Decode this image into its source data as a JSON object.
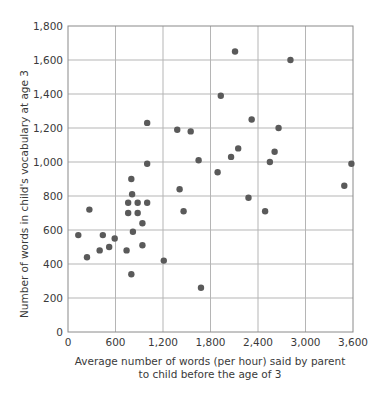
{
  "chart_data": {
    "type": "scatter",
    "title": "",
    "xlabel": "Average number of words (per hour) said by parent to child before the age of 3",
    "xlabel_lines": [
      "Average number of words (per hour) said by parent",
      "to child before the age of 3"
    ],
    "ylabel": "Number of words in child's vocabulary at age 3",
    "xlim": [
      0,
      3600
    ],
    "ylim": [
      0,
      1800
    ],
    "xticks": [
      0,
      600,
      1200,
      1800,
      2400,
      3000,
      3600
    ],
    "xtick_labels": [
      "0",
      "600",
      "1,200",
      "1,800",
      "2,400",
      "3,000",
      "3,600"
    ],
    "yticks": [
      0,
      200,
      400,
      600,
      800,
      1000,
      1200,
      1400,
      1600,
      1800
    ],
    "ytick_labels": [
      "0",
      "200",
      "400",
      "600",
      "800",
      "1,000",
      "1,200",
      "1,400",
      "1,600",
      "1,800"
    ],
    "grid": true,
    "legend": null,
    "marker_color": "#5a5a5a",
    "points": [
      {
        "x": 130,
        "y": 570
      },
      {
        "x": 240,
        "y": 440
      },
      {
        "x": 270,
        "y": 720
      },
      {
        "x": 400,
        "y": 480
      },
      {
        "x": 440,
        "y": 570
      },
      {
        "x": 520,
        "y": 500
      },
      {
        "x": 590,
        "y": 550
      },
      {
        "x": 740,
        "y": 480
      },
      {
        "x": 760,
        "y": 700
      },
      {
        "x": 760,
        "y": 760
      },
      {
        "x": 800,
        "y": 340
      },
      {
        "x": 800,
        "y": 900
      },
      {
        "x": 810,
        "y": 810
      },
      {
        "x": 820,
        "y": 590
      },
      {
        "x": 880,
        "y": 700
      },
      {
        "x": 880,
        "y": 760
      },
      {
        "x": 940,
        "y": 510
      },
      {
        "x": 940,
        "y": 640
      },
      {
        "x": 1000,
        "y": 760
      },
      {
        "x": 1000,
        "y": 990
      },
      {
        "x": 1000,
        "y": 1230
      },
      {
        "x": 1210,
        "y": 420
      },
      {
        "x": 1380,
        "y": 1190
      },
      {
        "x": 1410,
        "y": 840
      },
      {
        "x": 1460,
        "y": 710
      },
      {
        "x": 1550,
        "y": 1180
      },
      {
        "x": 1650,
        "y": 1010
      },
      {
        "x": 1680,
        "y": 260
      },
      {
        "x": 1890,
        "y": 940
      },
      {
        "x": 1930,
        "y": 1390
      },
      {
        "x": 2060,
        "y": 1030
      },
      {
        "x": 2110,
        "y": 1650
      },
      {
        "x": 2150,
        "y": 1080
      },
      {
        "x": 2280,
        "y": 790
      },
      {
        "x": 2320,
        "y": 1250
      },
      {
        "x": 2490,
        "y": 710
      },
      {
        "x": 2550,
        "y": 1000
      },
      {
        "x": 2610,
        "y": 1060
      },
      {
        "x": 2660,
        "y": 1200
      },
      {
        "x": 2810,
        "y": 1600
      },
      {
        "x": 3490,
        "y": 860
      },
      {
        "x": 3580,
        "y": 990
      }
    ]
  }
}
